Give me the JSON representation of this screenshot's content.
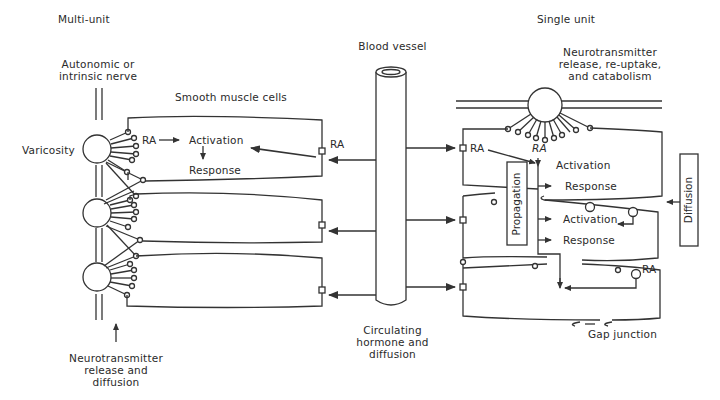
{
  "diagram": {
    "title_left": "Multi-unit",
    "title_right": "Single unit",
    "multi_unit": {
      "nerve_label": "Autonomic or\nintrinsic nerve",
      "varicosity_label": "Varicosity",
      "cells_label": "Smooth muscle cells",
      "ra_label": "RA",
      "activation_label": "Activation",
      "response_label": "Response",
      "receptor_ra_label": "RA",
      "bottom_label": "Neurotransmitter\nrelease and\ndiffusion"
    },
    "center": {
      "vessel_label": "Blood vessel",
      "bottom_label": "Circulating\nhormone and\ndiffusion"
    },
    "single_unit": {
      "top_label": "Neurotransmitter\nrelease, re-uptake,\nand catabolism",
      "ra_left_label": "RA",
      "ra_top_label": "RA",
      "activation_1": "Activation",
      "response_1": "Response",
      "activation_2": "Activation",
      "response_2": "Response",
      "propagation_label": "Propagation",
      "diffusion_label": "Diffusion",
      "ra_bottom_label": "RA",
      "gap_junction_label": "Gap junction"
    }
  }
}
